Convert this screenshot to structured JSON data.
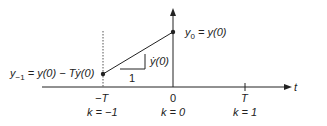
{
  "labels": {
    "y0": "y",
    "y0_sub": "0",
    "y0_rhs": " = y(0)",
    "ym1": "y",
    "ym1_sub": "−1",
    "ym1_rhs": " = y(0) − Tẏ(0)",
    "slope_rise": "ẏ(0)",
    "slope_run": "1",
    "t_axis": "t",
    "tick_neg": "−T",
    "tick_zero": "0",
    "tick_pos": "T",
    "k_neg": "k = −1",
    "k_zero": "k = 0",
    "k_pos": "k = 1"
  },
  "colors": {
    "line": "#222222",
    "dotted": "#555555"
  }
}
